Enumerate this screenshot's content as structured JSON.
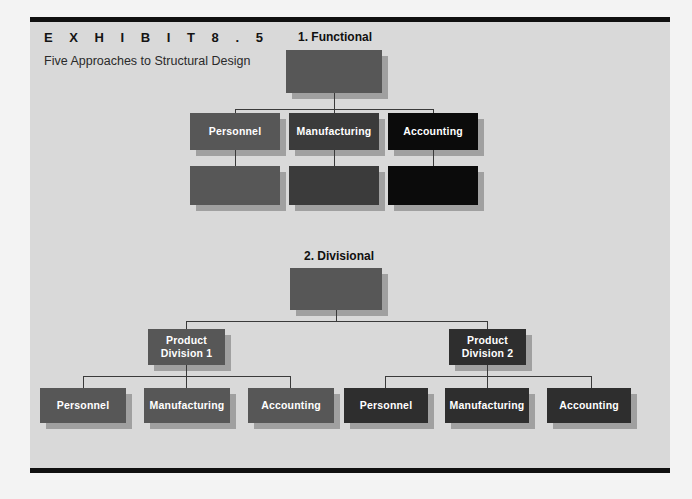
{
  "exhibit": {
    "label": "E X H I B I T      8 . 5",
    "subtitle": "Five Approaches to Structural Design"
  },
  "charts": [
    {
      "id": "functional",
      "title": "1. Functional",
      "root": {
        "label": ""
      },
      "level2": [
        {
          "label": "Personnel"
        },
        {
          "label": "Manufacturing"
        },
        {
          "label": "Accounting"
        }
      ],
      "level3": [
        {
          "label": ""
        },
        {
          "label": ""
        },
        {
          "label": ""
        }
      ]
    },
    {
      "id": "divisional",
      "title": "2. Divisional",
      "root": {
        "label": ""
      },
      "divisions": [
        {
          "label": "Product\nDivision 1",
          "line1": "Product",
          "line2": "Division 1",
          "children": [
            {
              "label": "Personnel"
            },
            {
              "label": "Manufacturing"
            },
            {
              "label": "Accounting"
            }
          ]
        },
        {
          "label": "Product\nDivision 2",
          "line1": "Product",
          "line2": "Division 2",
          "children": [
            {
              "label": "Personnel"
            },
            {
              "label": "Manufacturing"
            },
            {
              "label": "Accounting"
            }
          ]
        }
      ]
    }
  ],
  "colors": {
    "panel_background": "#d9d9d9",
    "page_background": "#f3f3f3",
    "rule": "#101010",
    "tone_light": "#636363",
    "tone_mid": "#575757",
    "tone_dark": "#3b3b3b",
    "tone_darker": "#2e2e2e",
    "tone_black": "#0b0b0b",
    "connector": "#3a3a3a",
    "node_text": "#ffffff"
  }
}
